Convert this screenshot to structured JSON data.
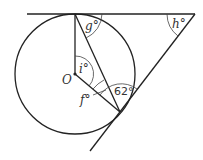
{
  "diagram": {
    "type": "circle-geometry",
    "center_label": "O",
    "angles": {
      "g": "g°",
      "h": "h°",
      "i": "i°",
      "f": "f°",
      "given": "62°"
    },
    "elements": [
      "circle with centre O",
      "horizontal tangent line at top of circle",
      "second tangent line touching circle at lower right",
      "radius from O to top tangent point",
      "radius from O to lower tangent point",
      "chord joining the two tangent points"
    ]
  }
}
